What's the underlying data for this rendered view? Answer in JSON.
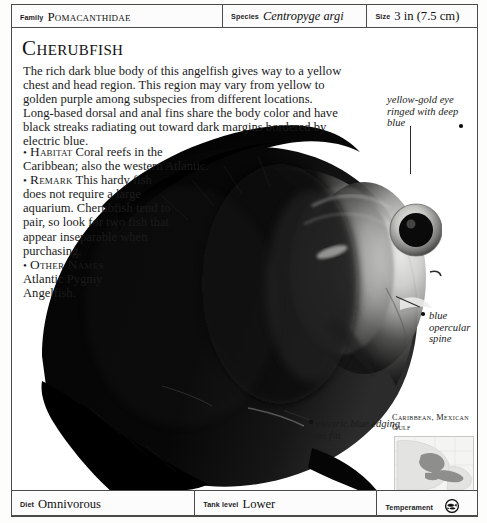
{
  "header": {
    "family": {
      "label": "Family",
      "value": "Pomacanthidae"
    },
    "species": {
      "label": "Species",
      "value": "Centropyge argi"
    },
    "size": {
      "label": "Size",
      "value": "3 in (7.5 cm)"
    }
  },
  "title": "Cherubfish",
  "intro": "The rich dark blue body of this angelfish gives way to a yellow chest and head region. This region may vary from yellow to golden purple among subspecies from different locations. Long-based dorsal and anal fins share the body color and have black streaks radiating out toward dark margins bordered by electric blue.",
  "facts": [
    {
      "bullet": "•",
      "key": "Habitat",
      "text": "Coral reefs in the Caribbean; also the western Atlantic."
    },
    {
      "bullet": "•",
      "key": "Remark",
      "text": "This hardy fish does not require a large aquarium. Cherubfish tend to pair, so look for two fish that appear inseparable when purchasing."
    },
    {
      "bullet": "•",
      "key": "Other Names",
      "text": "Atlantic Pygmy Angelfish."
    }
  ],
  "annotations": [
    {
      "name": "eye-annotation",
      "text": "yellow-gold eye ringed with deep blue"
    },
    {
      "name": "opercular-spine-annotation",
      "text": "blue opercular spine"
    },
    {
      "name": "fin-edging-annotation",
      "text": "electric blue edging on fin"
    }
  ],
  "map": {
    "title": "Caribbean, Mexican Gulf",
    "icon": "region-map"
  },
  "footer": {
    "diet": {
      "label": "Diet",
      "value": "Omnivorous"
    },
    "tank_level": {
      "label": "Tank level",
      "value": "Lower"
    },
    "temperament": {
      "label": "Temperament",
      "value": "",
      "icon": "two-fish-temperament-icon"
    }
  },
  "colors": {
    "rule": "#4a4a4a",
    "text": "#1b1b1b",
    "paper": "#ffffff",
    "fish_dark": "#0b0b0b",
    "fish_light": "#b9b9b6"
  }
}
